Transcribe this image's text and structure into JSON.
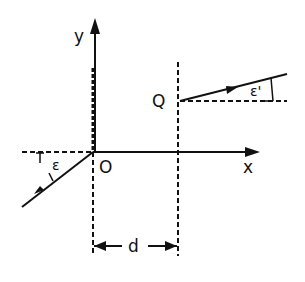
{
  "diagram": {
    "labels": {
      "y_axis": "y",
      "x_axis": "x",
      "origin": "O",
      "point_q": "Q",
      "incident_angle": "ε",
      "exit_angle": "ε'",
      "distance": "d"
    },
    "elements": [
      {
        "type": "axis",
        "name": "x-axis",
        "direction": "right"
      },
      {
        "type": "axis",
        "name": "y-axis",
        "direction": "up"
      },
      {
        "type": "ray",
        "name": "incident-ray",
        "from": "lower-left",
        "to": "O",
        "angle_symbol": "ε"
      },
      {
        "type": "ray",
        "name": "exit-ray",
        "from": "Q",
        "to": "upper-right",
        "angle_symbol": "ε'"
      },
      {
        "type": "dashed-line",
        "name": "vertical-through-Q"
      },
      {
        "type": "dimension",
        "name": "separation",
        "between": [
          "O",
          "Q"
        ],
        "label": "d"
      }
    ]
  }
}
